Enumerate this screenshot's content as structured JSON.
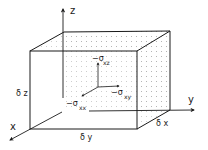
{
  "diagram": {
    "type": "3d-stress-element",
    "axes": {
      "x": "x",
      "y": "y",
      "z": "z"
    },
    "dimensions": {
      "dx": "δ x",
      "dy": "δ y",
      "dz": "δ z"
    },
    "stresses": {
      "xz": {
        "sign": "−σ",
        "sub": "xz"
      },
      "xy": {
        "sign": "−σ",
        "sub": "xy"
      },
      "xx": {
        "sign": "−σ",
        "sub": "xx"
      }
    },
    "colors": {
      "line": "#1a1a1a",
      "stipple": "#9a9a9a",
      "background": "#ffffff"
    }
  }
}
